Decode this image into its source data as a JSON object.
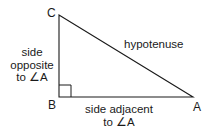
{
  "diagram": {
    "type": "right-triangle",
    "colors": {
      "stroke": "#1a1a1a",
      "text": "#1a1a1a",
      "background": "#ffffff"
    },
    "vertices": {
      "A": {
        "label": "A",
        "x": 193,
        "y": 97
      },
      "B": {
        "label": "B",
        "x": 59,
        "y": 97
      },
      "C": {
        "label": "C",
        "x": 59,
        "y": 15
      }
    },
    "right_angle_at": "B",
    "sides": {
      "hypotenuse": {
        "label": "hypotenuse"
      },
      "opposite": {
        "line1": "side",
        "line2": "opposite",
        "line3": "to ∠A"
      },
      "adjacent": {
        "line1": "side adjacent",
        "line2": "to ∠A"
      }
    }
  }
}
